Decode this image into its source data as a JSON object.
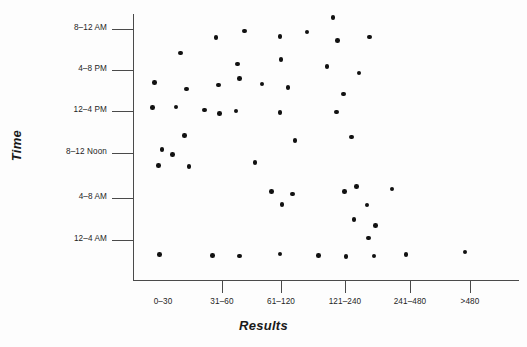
{
  "chart_data": {
    "type": "scatter",
    "title": "",
    "xlabel": "Results",
    "ylabel": "Time",
    "grid": false,
    "legend": null,
    "x_categories": [
      "0–30",
      "31–60",
      "61–120",
      "121–240",
      "241–480",
      ">480"
    ],
    "y_categories": [
      "12–4 AM",
      "4–8 AM",
      "8–12 Noon",
      "12–4 PM",
      "4–8 PM",
      "8–12 AM"
    ],
    "y_tick_order_top_to_bottom": [
      "8–12 AM",
      "4–8 PM",
      "12–4 PM",
      "8–12 Noon",
      "4–8 AM",
      "12–4 AM"
    ],
    "n_points": 58,
    "points": [
      {
        "x": 1.12,
        "y": 5.25
      },
      {
        "x": 1.6,
        "y": 5.4
      },
      {
        "x": 2.2,
        "y": 5.28
      },
      {
        "x": 2.66,
        "y": 5.38
      },
      {
        "x": 3.1,
        "y": 5.72
      },
      {
        "x": 3.18,
        "y": 5.18
      },
      {
        "x": 3.72,
        "y": 5.26
      },
      {
        "x": 0.52,
        "y": 4.88
      },
      {
        "x": 1.48,
        "y": 4.62
      },
      {
        "x": 2.22,
        "y": 4.72
      },
      {
        "x": 3.0,
        "y": 4.56
      },
      {
        "x": 3.54,
        "y": 4.4
      },
      {
        "x": 0.08,
        "y": 4.18
      },
      {
        "x": 0.62,
        "y": 4.02
      },
      {
        "x": 1.16,
        "y": 4.12
      },
      {
        "x": 1.52,
        "y": 4.28
      },
      {
        "x": 1.9,
        "y": 4.14
      },
      {
        "x": 2.34,
        "y": 4.06
      },
      {
        "x": 3.28,
        "y": 3.9
      },
      {
        "x": 0.04,
        "y": 3.58
      },
      {
        "x": 0.44,
        "y": 3.6
      },
      {
        "x": 0.92,
        "y": 3.52
      },
      {
        "x": 1.18,
        "y": 3.44
      },
      {
        "x": 1.46,
        "y": 3.5
      },
      {
        "x": 2.2,
        "y": 3.46
      },
      {
        "x": 3.16,
        "y": 3.48
      },
      {
        "x": 0.58,
        "y": 2.92
      },
      {
        "x": 2.46,
        "y": 2.8
      },
      {
        "x": 3.42,
        "y": 2.88
      },
      {
        "x": 0.2,
        "y": 2.58
      },
      {
        "x": 0.38,
        "y": 2.46
      },
      {
        "x": 0.14,
        "y": 2.2
      },
      {
        "x": 0.66,
        "y": 2.18
      },
      {
        "x": 1.78,
        "y": 2.28
      },
      {
        "x": 2.06,
        "y": 1.58
      },
      {
        "x": 2.42,
        "y": 1.52
      },
      {
        "x": 2.24,
        "y": 1.28
      },
      {
        "x": 3.3,
        "y": 1.58
      },
      {
        "x": 3.5,
        "y": 1.7
      },
      {
        "x": 4.1,
        "y": 1.64
      },
      {
        "x": 3.68,
        "y": 1.26
      },
      {
        "x": 3.46,
        "y": 0.92
      },
      {
        "x": 3.82,
        "y": 0.78
      },
      {
        "x": 3.7,
        "y": 0.48
      },
      {
        "x": 0.16,
        "y": 0.08
      },
      {
        "x": 1.06,
        "y": 0.06
      },
      {
        "x": 1.52,
        "y": 0.05
      },
      {
        "x": 2.2,
        "y": 0.1
      },
      {
        "x": 2.86,
        "y": 0.06
      },
      {
        "x": 3.32,
        "y": 0.04
      },
      {
        "x": 3.8,
        "y": 0.05
      },
      {
        "x": 4.34,
        "y": 0.08
      },
      {
        "x": 5.34,
        "y": 0.14
      }
    ]
  },
  "axes": {
    "ylabel": "Time",
    "xlabel": "Results",
    "yticks": [
      {
        "label": "8–12 AM",
        "px": 29
      },
      {
        "label": "4–8 PM",
        "px": 70
      },
      {
        "label": "12–4 PM",
        "px": 111
      },
      {
        "label": "8–12 Noon",
        "px": 153
      },
      {
        "label": "4–8 AM",
        "px": 198
      },
      {
        "label": "12–4 AM",
        "px": 240
      }
    ],
    "xticks": [
      {
        "label": "0–30",
        "px": 163,
        "tick_px": 222
      },
      {
        "label": "31–60",
        "px": 222,
        "tick_px": 281
      },
      {
        "label": "61–120",
        "px": 281,
        "tick_px": 345
      },
      {
        "label": "121–240",
        "px": 345,
        "tick_px": 410
      },
      {
        "label": "241–480",
        "px": 410,
        "tick_px": 470
      },
      {
        "label": ">480",
        "px": 470,
        "tick_px": null
      }
    ]
  },
  "colors": {
    "point": "#111111",
    "axis": "#4a4a4a",
    "text": "#1d1d1d",
    "background": "#fdfdfd"
  }
}
